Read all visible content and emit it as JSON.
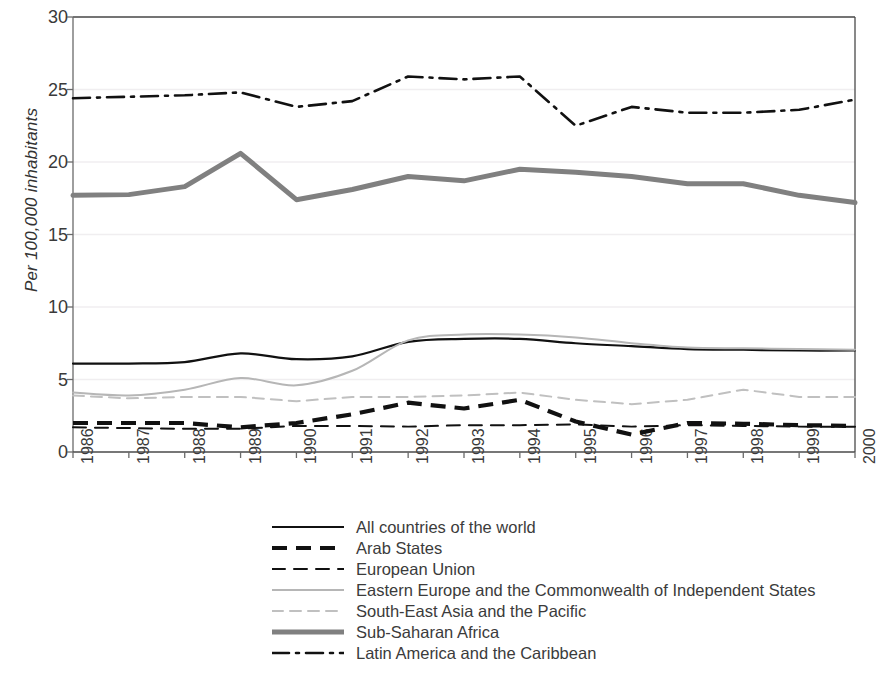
{
  "chart_data": {
    "type": "line",
    "title": "",
    "xlabel": "",
    "ylabel": "Per 100,000 inhabitants",
    "ylim": [
      0,
      30
    ],
    "yticks": [
      0,
      5,
      10,
      15,
      20,
      25,
      30
    ],
    "grid": true,
    "legend_position": "bottom",
    "categories": [
      "1986",
      "1987",
      "1988",
      "1989",
      "1990",
      "1991",
      "1992",
      "1993",
      "1994",
      "1995",
      "1996",
      "1997",
      "1998",
      "1999",
      "2000"
    ],
    "series": [
      {
        "name": "All countries of the world",
        "style": "solid",
        "color": "#111111",
        "width": 2.2,
        "values": [
          6.1,
          6.1,
          6.2,
          6.8,
          6.4,
          6.6,
          7.6,
          7.8,
          7.8,
          7.5,
          7.3,
          7.1,
          7.05,
          7.0,
          7.0
        ]
      },
      {
        "name": "Arab States",
        "style": "dashed-bold",
        "color": "#111111",
        "width": 4.2,
        "values": [
          2.0,
          2.0,
          2.0,
          1.7,
          2.0,
          2.6,
          3.4,
          3.0,
          3.6,
          2.1,
          1.2,
          2.0,
          1.95,
          1.85,
          1.8
        ]
      },
      {
        "name": "European Union",
        "style": "dashed",
        "color": "#111111",
        "width": 2.0,
        "values": [
          1.7,
          1.65,
          1.6,
          1.6,
          1.8,
          1.8,
          1.75,
          1.85,
          1.85,
          1.9,
          1.75,
          1.85,
          1.8,
          1.75,
          1.75
        ]
      },
      {
        "name": "Eastern Europe and the Commonwealth of Independent States",
        "style": "solid",
        "color": "#b6b6b6",
        "width": 2.0,
        "values": [
          4.1,
          3.9,
          4.3,
          5.1,
          4.6,
          5.6,
          7.7,
          8.1,
          8.1,
          7.9,
          7.5,
          7.2,
          7.15,
          7.1,
          7.05
        ]
      },
      {
        "name": "South-East Asia and the Pacific",
        "style": "dashed-light",
        "color": "#c0c0c0",
        "width": 2.0,
        "values": [
          3.9,
          3.7,
          3.8,
          3.8,
          3.5,
          3.8,
          3.8,
          3.9,
          4.1,
          3.6,
          3.3,
          3.6,
          4.3,
          3.8,
          3.8
        ]
      },
      {
        "name": "Sub-Saharan Africa",
        "style": "solid-thick",
        "color": "#808080",
        "width": 5.0,
        "values": [
          17.7,
          17.75,
          18.3,
          20.6,
          17.4,
          18.1,
          19.0,
          18.7,
          19.5,
          19.3,
          19.0,
          18.5,
          18.5,
          17.7,
          17.2
        ]
      },
      {
        "name": "Latin America and the Caribbean",
        "style": "dash-dot",
        "color": "#111111",
        "width": 2.6,
        "values": [
          24.4,
          24.5,
          24.6,
          24.8,
          23.8,
          24.2,
          25.9,
          25.7,
          25.9,
          22.5,
          23.8,
          23.4,
          23.4,
          23.6,
          24.3
        ]
      }
    ]
  }
}
